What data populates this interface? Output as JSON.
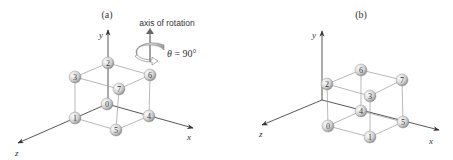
{
  "panels": [
    {
      "label": "(a)",
      "axes": {
        "x": "x",
        "y": "y",
        "z": "z"
      },
      "annotation": {
        "axis_label": "axis of rotation",
        "angle_label": "θ = 90°"
      },
      "nodes": [
        {
          "id": "0",
          "x": 107,
          "y": 104
        },
        {
          "id": "1",
          "x": 75,
          "y": 118
        },
        {
          "id": "2",
          "x": 108,
          "y": 63
        },
        {
          "id": "3",
          "x": 75,
          "y": 77
        },
        {
          "id": "4",
          "x": 149,
          "y": 116
        },
        {
          "id": "5",
          "x": 116,
          "y": 130
        },
        {
          "id": "6",
          "x": 150,
          "y": 75
        },
        {
          "id": "7",
          "x": 119,
          "y": 89
        }
      ]
    },
    {
      "label": "(b)",
      "axes": {
        "x": "x",
        "y": "y",
        "z": "z"
      },
      "nodes": [
        {
          "id": "0",
          "x": 328,
          "y": 126
        },
        {
          "id": "1",
          "x": 370,
          "y": 137
        },
        {
          "id": "2",
          "x": 327,
          "y": 84
        },
        {
          "id": "3",
          "x": 370,
          "y": 96
        },
        {
          "id": "4",
          "x": 361,
          "y": 111
        },
        {
          "id": "5",
          "x": 403,
          "y": 122
        },
        {
          "id": "6",
          "x": 361,
          "y": 70
        },
        {
          "id": "7",
          "x": 402,
          "y": 80
        }
      ]
    }
  ],
  "colors": {
    "line": "#999999",
    "axis": "#444444",
    "node_fill": "#dddddd",
    "text": "#333333"
  }
}
